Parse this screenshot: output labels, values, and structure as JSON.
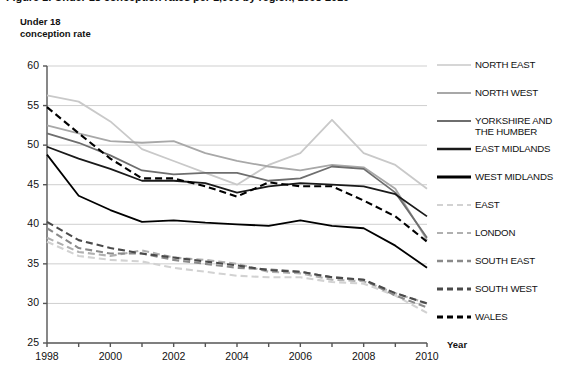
{
  "chart_title": "Figure 1: Under 18 conception rates per 1,000 by region, 1998-2010",
  "axes": {
    "y_title": "Under 18\nconception rate",
    "x_title": "Year",
    "y_ticks": [
      25,
      30,
      35,
      40,
      45,
      50,
      55,
      60
    ],
    "x_ticks": [
      1998,
      1999,
      2000,
      2001,
      2002,
      2003,
      2004,
      2005,
      2006,
      2007,
      2008,
      2009,
      2010
    ],
    "x_tick_labels": [
      "1998",
      "",
      "2000",
      "",
      "2002",
      "",
      "2004",
      "",
      "2006",
      "",
      "2008",
      "",
      "2010"
    ]
  },
  "colors": {
    "north_east": "#c9c9c9",
    "north_west": "#a8a8a8",
    "yorkshire": "#6e6e6e",
    "east_midlands": "#1a1a1a",
    "west_midlands": "#000000",
    "east": "#d2d2d2",
    "london": "#b0b0b0",
    "south_east": "#8a8a8a",
    "south_west": "#4a4a4a",
    "wales": "#000000",
    "gridline": "#cfcfcf",
    "axis": "#555555"
  },
  "chart_data": {
    "type": "line",
    "title": "Figure 1: Under 18 conception rates per 1,000 by region, 1998-2010",
    "xlabel": "Year",
    "ylabel": "Under 18 conception rate",
    "xlim": [
      1998,
      2010
    ],
    "ylim": [
      25,
      60
    ],
    "grid": true,
    "legend_position": "right",
    "x": [
      1998,
      1999,
      2000,
      2001,
      2002,
      2003,
      2004,
      2005,
      2006,
      2007,
      2008,
      2009,
      2010
    ],
    "series": [
      {
        "name": "NORTH EAST",
        "style": "solid",
        "color": "#c9c9c9",
        "values": [
          56.3,
          55.5,
          53.0,
          49.5,
          48.0,
          46.5,
          45.0,
          47.5,
          49.0,
          53.2,
          49.0,
          47.5,
          44.5
        ]
      },
      {
        "name": "NORTH WEST",
        "style": "solid",
        "color": "#a8a8a8",
        "values": [
          52.5,
          51.5,
          50.5,
          50.3,
          50.5,
          49.0,
          48.0,
          47.3,
          46.8,
          47.5,
          47.2,
          44.5,
          38.0
        ]
      },
      {
        "name": "YORKSHIRE AND THE HUMBER",
        "style": "solid",
        "color": "#6e6e6e",
        "values": [
          51.5,
          50.3,
          48.7,
          46.8,
          46.3,
          46.5,
          46.5,
          45.5,
          45.8,
          47.3,
          47.0,
          44.0,
          38.3
        ]
      },
      {
        "name": "EAST MIDLANDS",
        "style": "solid",
        "color": "#1a1a1a",
        "values": [
          49.8,
          48.3,
          47.0,
          45.5,
          45.5,
          45.2,
          44.0,
          44.8,
          45.2,
          45.0,
          44.8,
          43.8,
          41.0
        ]
      },
      {
        "name": "WEST MIDLANDS",
        "style": "solid",
        "color": "#000000",
        "values": [
          48.8,
          43.6,
          41.8,
          40.3,
          40.5,
          40.2,
          40.0,
          39.8,
          40.5,
          39.8,
          39.5,
          37.3,
          34.5
        ]
      },
      {
        "name": "EAST",
        "style": "dashed",
        "color": "#d2d2d2",
        "values": [
          37.8,
          36.0,
          35.5,
          35.3,
          34.5,
          34.0,
          33.5,
          33.3,
          33.3,
          32.7,
          32.5,
          31.0,
          28.8
        ]
      },
      {
        "name": "LONDON",
        "style": "dashed",
        "color": "#b0b0b0",
        "values": [
          38.3,
          36.5,
          36.0,
          36.7,
          35.8,
          35.5,
          35.0,
          34.0,
          33.8,
          33.0,
          32.8,
          31.3,
          30.0
        ]
      },
      {
        "name": "SOUTH EAST",
        "style": "dashed",
        "color": "#8a8a8a",
        "values": [
          39.5,
          37.0,
          36.3,
          36.3,
          35.5,
          35.0,
          34.5,
          34.3,
          34.0,
          33.3,
          33.0,
          31.0,
          29.5
        ]
      },
      {
        "name": "SOUTH WEST",
        "style": "dashed",
        "color": "#4a4a4a",
        "values": [
          40.3,
          38.0,
          37.0,
          36.3,
          35.8,
          35.3,
          34.8,
          34.2,
          34.0,
          33.3,
          33.0,
          31.3,
          30.0
        ]
      },
      {
        "name": "WALES",
        "style": "dashed",
        "color": "#000000",
        "values": [
          54.8,
          51.5,
          48.3,
          45.8,
          45.8,
          44.8,
          43.5,
          45.3,
          44.8,
          44.8,
          43.0,
          41.0,
          37.8
        ]
      }
    ]
  },
  "legend": {
    "items": [
      {
        "label": "NORTH EAST",
        "style": "solid",
        "color": "#c9c9c9",
        "width": 1.6
      },
      {
        "label": "NORTH WEST",
        "style": "solid",
        "color": "#a8a8a8",
        "width": 1.8
      },
      {
        "label": "YORKSHIRE AND\nTHE HUMBER",
        "style": "solid",
        "color": "#6e6e6e",
        "width": 2.0
      },
      {
        "label": "EAST MIDLANDS",
        "style": "solid",
        "color": "#1a1a1a",
        "width": 2.3
      },
      {
        "label": "WEST MIDLANDS",
        "style": "solid",
        "color": "#000000",
        "width": 2.8
      },
      {
        "label": "EAST",
        "style": "dashed",
        "color": "#d2d2d2",
        "width": 2.0
      },
      {
        "label": "LONDON",
        "style": "dashed",
        "color": "#b0b0b0",
        "width": 2.2
      },
      {
        "label": "SOUTH EAST",
        "style": "dashed",
        "color": "#8a8a8a",
        "width": 2.4
      },
      {
        "label": "SOUTH WEST",
        "style": "dashed",
        "color": "#4a4a4a",
        "width": 2.8
      },
      {
        "label": "WALES",
        "style": "dashed",
        "color": "#000000",
        "width": 3.0
      }
    ]
  }
}
